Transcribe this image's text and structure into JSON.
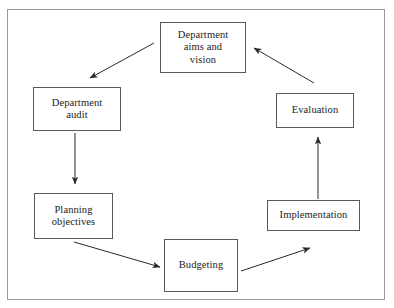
{
  "diagram": {
    "type": "cycle-flowchart",
    "frame": {
      "border_color": "#9a9a9a"
    },
    "box_style": {
      "border_color": "#5a5a5a",
      "fill": "#ffffff",
      "text_color": "#1c1c1c"
    },
    "arrow_color": "#2b2b2b",
    "nodes": [
      {
        "id": "aims",
        "label": "Department\naims and\nvision"
      },
      {
        "id": "audit",
        "label": "Department\naudit"
      },
      {
        "id": "plan",
        "label": "Planning\nobjectives"
      },
      {
        "id": "budget",
        "label": "Budgeting"
      },
      {
        "id": "impl",
        "label": "Implementation"
      },
      {
        "id": "eval",
        "label": "Evaluation"
      }
    ],
    "edges": [
      {
        "id": "aims-to-audit",
        "from": "aims",
        "to": "audit",
        "style": "diagonal-down-left"
      },
      {
        "id": "audit-to-plan",
        "from": "audit",
        "to": "plan",
        "style": "vertical-down"
      },
      {
        "id": "plan-to-budget",
        "from": "plan",
        "to": "budget",
        "style": "diagonal-down-right"
      },
      {
        "id": "budget-to-impl",
        "from": "budget",
        "to": "impl",
        "style": "diagonal-up-right"
      },
      {
        "id": "impl-to-eval",
        "from": "impl",
        "to": "eval",
        "style": "vertical-up"
      },
      {
        "id": "eval-to-aims",
        "from": "eval",
        "to": "aims",
        "style": "diagonal-up-left"
      }
    ]
  }
}
